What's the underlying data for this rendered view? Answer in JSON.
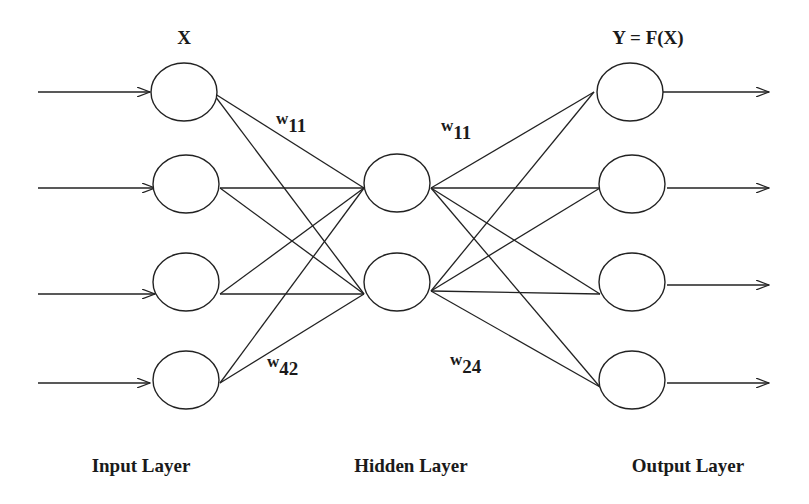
{
  "diagram": {
    "type": "neural-network",
    "top_labels": {
      "input": "X",
      "output": "Y = F(X)"
    },
    "layer_labels": {
      "input": "Input Layer",
      "hidden": "Hidden Layer",
      "output": "Output Layer"
    },
    "weights": [
      {
        "base": "w",
        "sub": "11",
        "position": "input-hidden-top"
      },
      {
        "base": "w",
        "sub": "42",
        "position": "input-hidden-bottom"
      },
      {
        "base": "w",
        "sub": "11",
        "position": "hidden-output-top"
      },
      {
        "base": "w",
        "sub": "24",
        "position": "hidden-output-bottom"
      }
    ],
    "layers": {
      "input_nodes": 4,
      "hidden_nodes": 2,
      "output_nodes": 4
    },
    "colors": {
      "stroke": "#222222",
      "background": "#ffffff"
    }
  }
}
